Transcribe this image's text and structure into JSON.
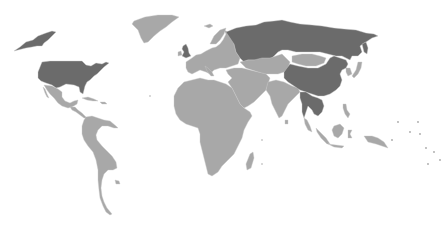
{
  "map": {
    "title": "World map",
    "colors": {
      "background": "#ffffff",
      "highlighted": "#6b6b6b",
      "default": "#a8a8a8",
      "border": "#c9c9c9"
    },
    "highlighted_countries": [
      "United States",
      "Alaska (US)",
      "Russia",
      "China",
      "United Kingdom",
      "Myanmar",
      "Thailand",
      "Cambodia"
    ],
    "regions": [
      {
        "name": "Alaska (US)",
        "highlighted": true
      },
      {
        "name": "United States",
        "highlighted": true
      },
      {
        "name": "Canada",
        "highlighted": false
      },
      {
        "name": "Greenland",
        "highlighted": false
      },
      {
        "name": "Mexico",
        "highlighted": false
      },
      {
        "name": "Central America",
        "highlighted": false
      },
      {
        "name": "Caribbean",
        "highlighted": false
      },
      {
        "name": "South America",
        "highlighted": false
      },
      {
        "name": "United Kingdom",
        "highlighted": true
      },
      {
        "name": "Ireland",
        "highlighted": false
      },
      {
        "name": "Iceland",
        "highlighted": false
      },
      {
        "name": "Europe",
        "highlighted": false
      },
      {
        "name": "Russia",
        "highlighted": true
      },
      {
        "name": "Africa",
        "highlighted": false
      },
      {
        "name": "Madagascar",
        "highlighted": false
      },
      {
        "name": "Middle East",
        "highlighted": false
      },
      {
        "name": "Central Asia",
        "highlighted": false
      },
      {
        "name": "India",
        "highlighted": false
      },
      {
        "name": "Sri Lanka",
        "highlighted": false
      },
      {
        "name": "Mongolia",
        "highlighted": false
      },
      {
        "name": "China",
        "highlighted": true
      },
      {
        "name": "Southeast Asia (mainland)",
        "highlighted": true
      },
      {
        "name": "Korea",
        "highlighted": false
      },
      {
        "name": "Japan",
        "highlighted": false
      },
      {
        "name": "Indonesia",
        "highlighted": false
      },
      {
        "name": "Philippines",
        "highlighted": false
      },
      {
        "name": "Papua New Guinea",
        "highlighted": false
      },
      {
        "name": "Pacific Islands",
        "highlighted": false
      }
    ]
  }
}
